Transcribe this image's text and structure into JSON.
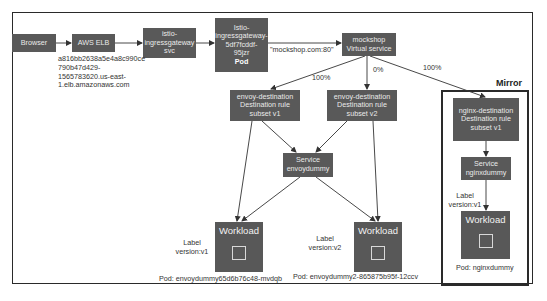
{
  "diagram": {
    "nodes": {
      "browser": {
        "label": "Browser"
      },
      "aws_elb": {
        "label": "AWS ELB"
      },
      "ingress_svc": {
        "line1": "istio-",
        "line2": "ingressgateway",
        "line3": "svc"
      },
      "ingress_pod": {
        "line1": "Istio-",
        "line2": "ingressgateway-",
        "line3": "5df7fcddf-",
        "line4": "95jzr",
        "line5": "Pod"
      },
      "mockshop_vs": {
        "line1": "mockshop",
        "line2": "Virtual service"
      },
      "envoy_dest_v1": {
        "line1": "envoy-destination",
        "line2": "Destination rule",
        "line3": "subset v1"
      },
      "envoy_dest_v2": {
        "line1": "envoy-destination",
        "line2": "Destination rule",
        "line3": "subset v2"
      },
      "service_envoydummy": {
        "line1": "Service",
        "line2": "envoydummy"
      },
      "workload_v1": {
        "title": "Workload"
      },
      "workload_v2": {
        "title": "Workload"
      },
      "nginx_dest": {
        "line1": "nginx-destination",
        "line2": "Destination rule",
        "line3": "subset v1"
      },
      "service_nginxdummy": {
        "line1": "Service",
        "line2": "nginxdummy"
      },
      "workload_nginx": {
        "title": "Workload"
      }
    },
    "annotations": {
      "elb_hostname": [
        "a816bb2638a5e4a8c990ce",
        "790b47d429-",
        "1565783620.us-east-",
        "1.elb.amazonaws.com"
      ],
      "host_label": "\"mockshop.com:80\"",
      "pct_v1": "100%",
      "pct_v2": "0%",
      "pct_mirror": "100%",
      "label_v1": [
        "Label",
        "version:v1"
      ],
      "label_v2": [
        "Label",
        "version:v2"
      ],
      "label_nginx": [
        "Label",
        "version:v1"
      ],
      "pod_v1": "Pod: envoydummy65d6b76c48-mvdqb",
      "pod_v2": "Pod: envoydummy2-865875b95f-12ccv",
      "pod_nginx": "Pod: nginxdummy",
      "mirror_title": "Mirror"
    },
    "colors": {
      "box_fill": "#595959",
      "box_text": "#eaeaea",
      "line": "#333333",
      "frame": "#2a2a2a"
    }
  }
}
